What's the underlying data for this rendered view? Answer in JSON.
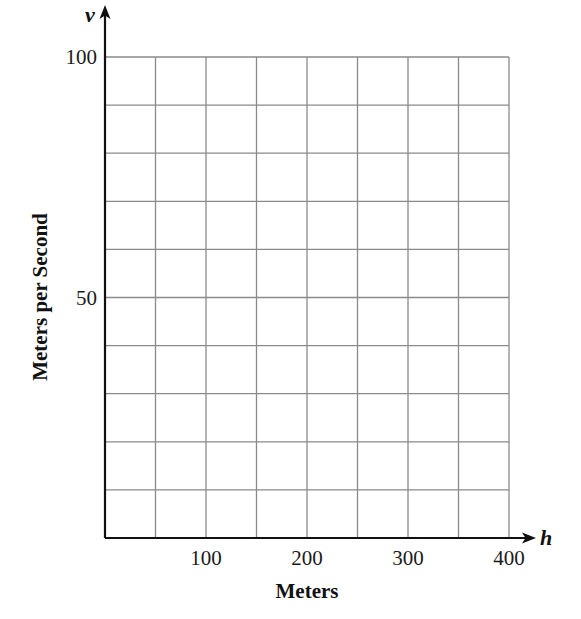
{
  "chart_data": {
    "type": "line",
    "title": "",
    "xlabel": "Meters",
    "ylabel": "Meters per Second",
    "x_variable": "h",
    "y_variable": "v",
    "xlim": [
      0,
      400
    ],
    "ylim": [
      0,
      100
    ],
    "x_ticks": [
      100,
      200,
      300,
      400
    ],
    "x_tick_labels": [
      "100",
      "200",
      "300",
      "400"
    ],
    "y_ticks": [
      50,
      100
    ],
    "y_tick_labels": [
      "50",
      "100"
    ],
    "x_grid_step": 50,
    "y_grid_step": 10,
    "grid": true,
    "legend": null,
    "series": []
  },
  "colors": {
    "axis": "#111111",
    "grid": "#8a8a8a",
    "background": "#ffffff"
  }
}
